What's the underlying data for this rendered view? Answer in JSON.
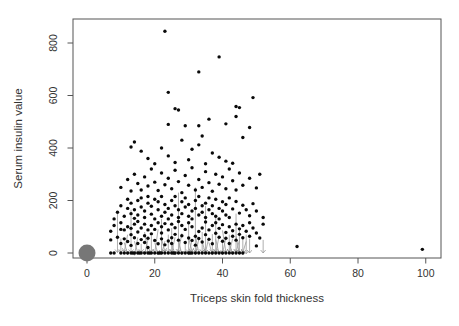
{
  "chart_data": {
    "type": "scatter",
    "title": "",
    "xlabel": "Triceps skin fold thickness",
    "ylabel": "Serum insulin value",
    "xlim": [
      -4,
      104
    ],
    "ylim": [
      -20,
      890
    ],
    "x_ticks": [
      0,
      20,
      40,
      60,
      80,
      100
    ],
    "y_ticks": [
      0,
      200,
      400,
      600,
      800
    ],
    "grid": false,
    "legend": "none",
    "point_color": "#0a0a0a",
    "arrow_color": "#999999",
    "origin_cluster": {
      "x": 0,
      "y": 0,
      "color": "#777777",
      "radius_px": 8.5
    },
    "zero_x": [
      7,
      8,
      10,
      11,
      12,
      13,
      13.5,
      14,
      15,
      15.5,
      16,
      17,
      18,
      18.5,
      19,
      20,
      21,
      21.5,
      22,
      23,
      24,
      25,
      25.5,
      26,
      27,
      28,
      29,
      30,
      30.5,
      31,
      32,
      33,
      34,
      35,
      36,
      37,
      38,
      39,
      40,
      41,
      42,
      43,
      44,
      45,
      46
    ],
    "points": [
      [
        7,
        50
      ],
      [
        7,
        83
      ],
      [
        8,
        105
      ],
      [
        9,
        60
      ],
      [
        10,
        36
      ],
      [
        10,
        90
      ],
      [
        10,
        115
      ],
      [
        11,
        54
      ],
      [
        11,
        88
      ],
      [
        12,
        44
      ],
      [
        12,
        100
      ],
      [
        13,
        70
      ],
      [
        13,
        29
      ],
      [
        13,
        94
      ],
      [
        14,
        58
      ],
      [
        14,
        110
      ],
      [
        15,
        36
      ],
      [
        15,
        80
      ],
      [
        15,
        120
      ],
      [
        16,
        51
      ],
      [
        16,
        95
      ],
      [
        17,
        66
      ],
      [
        17,
        110
      ],
      [
        17,
        40
      ],
      [
        18,
        56
      ],
      [
        18,
        88
      ],
      [
        18,
        21
      ],
      [
        19,
        73
      ],
      [
        19,
        105
      ],
      [
        20,
        48
      ],
      [
        20,
        90
      ],
      [
        21,
        35
      ],
      [
        21,
        115
      ],
      [
        22,
        76
      ],
      [
        22,
        54
      ],
      [
        22,
        100
      ],
      [
        23,
        31
      ],
      [
        23,
        112
      ],
      [
        24,
        46
      ],
      [
        24,
        88
      ],
      [
        25,
        58
      ],
      [
        25,
        110
      ],
      [
        25,
        36
      ],
      [
        26,
        71
      ],
      [
        26,
        96
      ],
      [
        27,
        49
      ],
      [
        27,
        120
      ],
      [
        28,
        66
      ],
      [
        28,
        105
      ],
      [
        29,
        40
      ],
      [
        29,
        90
      ],
      [
        30,
        57
      ],
      [
        30,
        115
      ],
      [
        31,
        48
      ],
      [
        31,
        100
      ],
      [
        32,
        64
      ],
      [
        32,
        30
      ],
      [
        33,
        82
      ],
      [
        33,
        55
      ],
      [
        34,
        95
      ],
      [
        34,
        42
      ],
      [
        35,
        70
      ],
      [
        35,
        118
      ],
      [
        36,
        88
      ],
      [
        36,
        52
      ],
      [
        37,
        105
      ],
      [
        37,
        35
      ],
      [
        38,
        75
      ],
      [
        38,
        115
      ],
      [
        39,
        60
      ],
      [
        39,
        94
      ],
      [
        40,
        45
      ],
      [
        40,
        108
      ],
      [
        41,
        78
      ],
      [
        41,
        56
      ],
      [
        42,
        100
      ],
      [
        42,
        36
      ],
      [
        43,
        85
      ],
      [
        43,
        64
      ],
      [
        44,
        110
      ],
      [
        44,
        49
      ],
      [
        45,
        92
      ],
      [
        45,
        71
      ],
      [
        46,
        58
      ],
      [
        46,
        105
      ],
      [
        47,
        83
      ],
      [
        48,
        64
      ],
      [
        48,
        115
      ],
      [
        49,
        95
      ],
      [
        50,
        76
      ],
      [
        51,
        57
      ],
      [
        52,
        110
      ],
      [
        8,
        130
      ],
      [
        9,
        155
      ],
      [
        10,
        180
      ],
      [
        11,
        140
      ],
      [
        12,
        170
      ],
      [
        12,
        205
      ],
      [
        13,
        150
      ],
      [
        13,
        190
      ],
      [
        14,
        132
      ],
      [
        14,
        165
      ],
      [
        15,
        200
      ],
      [
        15,
        145
      ],
      [
        16,
        175
      ],
      [
        16,
        210
      ],
      [
        17,
        135
      ],
      [
        17,
        160
      ],
      [
        18,
        190
      ],
      [
        18,
        215
      ],
      [
        19,
        148
      ],
      [
        19,
        178
      ],
      [
        20,
        130
      ],
      [
        20,
        205
      ],
      [
        21,
        165
      ],
      [
        21,
        195
      ],
      [
        22,
        140
      ],
      [
        22,
        215
      ],
      [
        23,
        155
      ],
      [
        23,
        185
      ],
      [
        24,
        130
      ],
      [
        24,
        170
      ],
      [
        25,
        200
      ],
      [
        25,
        145
      ],
      [
        26,
        180
      ],
      [
        26,
        215
      ],
      [
        27,
        135
      ],
      [
        27,
        165
      ],
      [
        28,
        195
      ],
      [
        28,
        150
      ],
      [
        29,
        175
      ],
      [
        29,
        210
      ],
      [
        30,
        140
      ],
      [
        30,
        185
      ],
      [
        31,
        160
      ],
      [
        31,
        130
      ],
      [
        32,
        200
      ],
      [
        32,
        170
      ],
      [
        33,
        145
      ],
      [
        33,
        215
      ],
      [
        34,
        180
      ],
      [
        34,
        155
      ],
      [
        35,
        135
      ],
      [
        35,
        190
      ],
      [
        36,
        165
      ],
      [
        36,
        210
      ],
      [
        37,
        150
      ],
      [
        37,
        180
      ],
      [
        38,
        140
      ],
      [
        38,
        205
      ],
      [
        39,
        170
      ],
      [
        39,
        130
      ],
      [
        40,
        195
      ],
      [
        40,
        160
      ],
      [
        41,
        145
      ],
      [
        41,
        185
      ],
      [
        42,
        210
      ],
      [
        42,
        135
      ],
      [
        43,
        168
      ],
      [
        44,
        196
      ],
      [
        45,
        152
      ],
      [
        46,
        182
      ],
      [
        47,
        165
      ],
      [
        48,
        142
      ],
      [
        49,
        188
      ],
      [
        50,
        160
      ],
      [
        52,
        135
      ],
      [
        10,
        250
      ],
      [
        12,
        280
      ],
      [
        13,
        236
      ],
      [
        14,
        300
      ],
      [
        15,
        265
      ],
      [
        16,
        240
      ],
      [
        17,
        290
      ],
      [
        18,
        255
      ],
      [
        19,
        320
      ],
      [
        20,
        270
      ],
      [
        21,
        238
      ],
      [
        22,
        305
      ],
      [
        23,
        260
      ],
      [
        24,
        285
      ],
      [
        25,
        245
      ],
      [
        26,
        315
      ],
      [
        27,
        272
      ],
      [
        28,
        230
      ],
      [
        29,
        295
      ],
      [
        30,
        258
      ],
      [
        31,
        325
      ],
      [
        32,
        240
      ],
      [
        33,
        280
      ],
      [
        34,
        250
      ],
      [
        35,
        310
      ],
      [
        36,
        268
      ],
      [
        37,
        235
      ],
      [
        38,
        300
      ],
      [
        39,
        262
      ],
      [
        40,
        290
      ],
      [
        41,
        245
      ],
      [
        42,
        320
      ],
      [
        43,
        275
      ],
      [
        44,
        240
      ],
      [
        45,
        305
      ],
      [
        46,
        258
      ],
      [
        48,
        285
      ],
      [
        50,
        248
      ],
      [
        51,
        300
      ],
      [
        13,
        404
      ],
      [
        14,
        423
      ],
      [
        16,
        388
      ],
      [
        18,
        360
      ],
      [
        20,
        340
      ],
      [
        22,
        400
      ],
      [
        24,
        370
      ],
      [
        26,
        345
      ],
      [
        28,
        430
      ],
      [
        30,
        355
      ],
      [
        31,
        395
      ],
      [
        33,
        412
      ],
      [
        34,
        446
      ],
      [
        35,
        340
      ],
      [
        37,
        381
      ],
      [
        39,
        365
      ],
      [
        41,
        350
      ],
      [
        43,
        342
      ],
      [
        46,
        440
      ],
      [
        24,
        490
      ],
      [
        26,
        550
      ],
      [
        27,
        545
      ],
      [
        29,
        485
      ],
      [
        33,
        485
      ],
      [
        36,
        510
      ],
      [
        41,
        492
      ],
      [
        44,
        520
      ],
      [
        44,
        558
      ],
      [
        45,
        554
      ],
      [
        48,
        478
      ],
      [
        49,
        592
      ],
      [
        24,
        612
      ],
      [
        23,
        845
      ],
      [
        33,
        690
      ],
      [
        39,
        747
      ],
      [
        50,
        27
      ],
      [
        62,
        25
      ],
      [
        99,
        14
      ]
    ],
    "arrows": [
      [
        9,
        150,
        9,
        2
      ],
      [
        10,
        55,
        10,
        2
      ],
      [
        11,
        40,
        12,
        -5
      ],
      [
        12,
        70,
        11,
        5
      ],
      [
        13,
        165,
        13,
        2
      ],
      [
        14,
        45,
        15,
        0
      ],
      [
        15,
        60,
        14,
        -8
      ],
      [
        16,
        35,
        16,
        3
      ],
      [
        17,
        80,
        18,
        0
      ],
      [
        18,
        50,
        17,
        -5
      ],
      [
        19,
        65,
        19,
        4
      ],
      [
        20,
        40,
        21,
        -6
      ],
      [
        21,
        90,
        20,
        2
      ],
      [
        22,
        130,
        22,
        0
      ],
      [
        22,
        55,
        23,
        5
      ],
      [
        23,
        45,
        22,
        -4
      ],
      [
        24,
        70,
        24,
        2
      ],
      [
        25,
        38,
        26,
        -7
      ],
      [
        25,
        95,
        25,
        5
      ],
      [
        26,
        60,
        25,
        0
      ],
      [
        27,
        230,
        27,
        3
      ],
      [
        27,
        50,
        28,
        -5
      ],
      [
        28,
        75,
        27,
        4
      ],
      [
        29,
        42,
        29,
        -2
      ],
      [
        30,
        120,
        30,
        2
      ],
      [
        30,
        58,
        31,
        6
      ],
      [
        31,
        48,
        30,
        -6
      ],
      [
        32,
        250,
        32,
        5
      ],
      [
        32,
        66,
        33,
        0
      ],
      [
        33,
        52,
        32,
        -5
      ],
      [
        34,
        80,
        34,
        3
      ],
      [
        34,
        44,
        35,
        -3
      ],
      [
        35,
        180,
        35,
        0
      ],
      [
        36,
        60,
        35,
        4
      ],
      [
        36,
        40,
        37,
        -6
      ],
      [
        37,
        72,
        37,
        2
      ],
      [
        38,
        140,
        38,
        4
      ],
      [
        38,
        52,
        39,
        -4
      ],
      [
        39,
        64,
        38,
        0
      ],
      [
        40,
        46,
        40,
        -7
      ],
      [
        40,
        86,
        41,
        3
      ],
      [
        41,
        58,
        40,
        -2
      ],
      [
        42,
        70,
        42,
        5
      ],
      [
        42,
        40,
        43,
        -5
      ],
      [
        43,
        55,
        42,
        0
      ],
      [
        44,
        150,
        44,
        2
      ],
      [
        44,
        64,
        45,
        -4
      ],
      [
        45,
        48,
        44,
        3
      ],
      [
        45,
        90,
        45,
        0
      ],
      [
        46,
        58,
        46,
        -6
      ],
      [
        47,
        44,
        46,
        2
      ],
      [
        47,
        70,
        47,
        -3
      ],
      [
        48,
        55,
        48,
        0
      ],
      [
        52,
        50,
        52,
        0
      ]
    ]
  }
}
